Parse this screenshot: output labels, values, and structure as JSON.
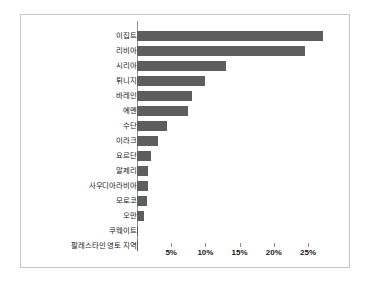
{
  "chart": {
    "type": "bar",
    "orientation": "horizontal",
    "background_color": "#ffffff",
    "border_color": "#c8c8c8",
    "bar_color": "#5e5e5e",
    "axis_color": "#8f8f8f"
  },
  "chart_data": {
    "type": "bar",
    "title": "",
    "subtitle": "",
    "xlabel": "",
    "ylabel": "",
    "orientation": "horizontal",
    "grid": false,
    "legend": false,
    "xlim": [
      0,
      28.5
    ],
    "xticks": [
      5,
      10,
      15,
      20,
      25
    ],
    "xticklabels": [
      "5%",
      "10%",
      "15%",
      "20%",
      "25%"
    ],
    "categories": [
      "이집트",
      "리비아",
      "시리아",
      "튀니지",
      "바레인",
      "예멘",
      "수단",
      "이라크",
      "요르단",
      "알제리",
      "사우디아라비아",
      "모로코",
      "오만",
      "쿠웨이트",
      "팔레스타인 영토 지역"
    ],
    "values": [
      27.2,
      24.5,
      13.0,
      10.0,
      8.0,
      7.4,
      4.4,
      3.0,
      2.0,
      1.6,
      1.6,
      1.4,
      1.0,
      0.15,
      0.15
    ]
  }
}
